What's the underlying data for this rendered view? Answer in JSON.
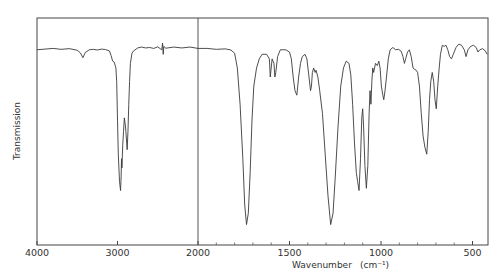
{
  "chart_data": {
    "type": "line",
    "title": "",
    "xlabel": "Wavenumber",
    "xlabel_unit": "(cm⁻¹)",
    "ylabel": "Transmission",
    "x_reversed": true,
    "xlim": [
      4000,
      420
    ],
    "x_scale_break": 2000,
    "ylim": [
      0,
      100
    ],
    "grid": false,
    "legend": "none",
    "x_ticks": [
      4000,
      3000,
      2000,
      1500,
      1000,
      500
    ],
    "x_tick_labels": [
      "4000",
      "3000",
      "2000",
      "1500",
      "1000",
      "500"
    ],
    "series": [
      {
        "name": "IR spectrum",
        "points": [
          [
            4000,
            86
          ],
          [
            3900,
            86.3
          ],
          [
            3800,
            86.6
          ],
          [
            3700,
            86.2
          ],
          [
            3600,
            86.5
          ],
          [
            3500,
            85.8
          ],
          [
            3460,
            84.6
          ],
          [
            3430,
            82.5
          ],
          [
            3400,
            84.8
          ],
          [
            3350,
            86
          ],
          [
            3300,
            86.2
          ],
          [
            3250,
            85.9
          ],
          [
            3200,
            86.3
          ],
          [
            3150,
            86.1
          ],
          [
            3100,
            85.5
          ],
          [
            3080,
            83.5
          ],
          [
            3060,
            81
          ],
          [
            3040,
            80.5
          ],
          [
            3020,
            78
          ],
          [
            3010,
            72
          ],
          [
            3000,
            55
          ],
          [
            2990,
            40
          ],
          [
            2975,
            28
          ],
          [
            2962,
            24
          ],
          [
            2955,
            30
          ],
          [
            2950,
            38
          ],
          [
            2945,
            34
          ],
          [
            2935,
            44
          ],
          [
            2925,
            50
          ],
          [
            2915,
            56
          ],
          [
            2900,
            52
          ],
          [
            2880,
            42
          ],
          [
            2870,
            50
          ],
          [
            2860,
            62
          ],
          [
            2850,
            72
          ],
          [
            2840,
            80
          ],
          [
            2820,
            84.5
          ],
          [
            2800,
            85.5
          ],
          [
            2750,
            86.8
          ],
          [
            2700,
            87.2
          ],
          [
            2650,
            86.8
          ],
          [
            2600,
            87
          ],
          [
            2550,
            86.6
          ],
          [
            2500,
            87.3
          ],
          [
            2470,
            86.5
          ],
          [
            2450,
            86
          ],
          [
            2440,
            89
          ],
          [
            2432,
            84
          ],
          [
            2425,
            87.5
          ],
          [
            2400,
            86.7
          ],
          [
            2300,
            87.2
          ],
          [
            2200,
            86.8
          ],
          [
            2100,
            87.2
          ],
          [
            2000,
            86.6
          ],
          [
            1950,
            86.6
          ],
          [
            1900,
            86.2
          ],
          [
            1850,
            86.4
          ],
          [
            1820,
            85.9
          ],
          [
            1800,
            84.5
          ],
          [
            1785,
            78
          ],
          [
            1770,
            62
          ],
          [
            1755,
            38
          ],
          [
            1745,
            18
          ],
          [
            1735,
            9
          ],
          [
            1725,
            14
          ],
          [
            1715,
            32
          ],
          [
            1705,
            55
          ],
          [
            1695,
            70
          ],
          [
            1680,
            78
          ],
          [
            1665,
            82
          ],
          [
            1650,
            84
          ],
          [
            1625,
            84
          ],
          [
            1610,
            82
          ],
          [
            1605,
            74
          ],
          [
            1600,
            78
          ],
          [
            1595,
            82
          ],
          [
            1585,
            80
          ],
          [
            1580,
            74
          ],
          [
            1575,
            76
          ],
          [
            1565,
            83
          ],
          [
            1550,
            86
          ],
          [
            1520,
            86
          ],
          [
            1500,
            85
          ],
          [
            1490,
            82
          ],
          [
            1480,
            74
          ],
          [
            1470,
            68
          ],
          [
            1460,
            66
          ],
          [
            1455,
            70
          ],
          [
            1450,
            74
          ],
          [
            1440,
            80
          ],
          [
            1430,
            83
          ],
          [
            1415,
            84
          ],
          [
            1405,
            82
          ],
          [
            1395,
            75
          ],
          [
            1385,
            68
          ],
          [
            1380,
            70
          ],
          [
            1375,
            76
          ],
          [
            1368,
            78
          ],
          [
            1360,
            76
          ],
          [
            1355,
            77
          ],
          [
            1345,
            74
          ],
          [
            1335,
            68
          ],
          [
            1320,
            58
          ],
          [
            1305,
            40
          ],
          [
            1290,
            22
          ],
          [
            1275,
            9
          ],
          [
            1262,
            14
          ],
          [
            1250,
            30
          ],
          [
            1235,
            52
          ],
          [
            1220,
            70
          ],
          [
            1205,
            78
          ],
          [
            1190,
            81
          ],
          [
            1175,
            80
          ],
          [
            1165,
            75
          ],
          [
            1155,
            62
          ],
          [
            1145,
            45
          ],
          [
            1135,
            32
          ],
          [
            1128,
            28
          ],
          [
            1120,
            24
          ],
          [
            1112,
            38
          ],
          [
            1105,
            56
          ],
          [
            1100,
            60
          ],
          [
            1095,
            52
          ],
          [
            1088,
            35
          ],
          [
            1080,
            25
          ],
          [
            1072,
            35
          ],
          [
            1065,
            58
          ],
          [
            1060,
            68
          ],
          [
            1055,
            62
          ],
          [
            1050,
            72
          ],
          [
            1045,
            78
          ],
          [
            1040,
            76
          ],
          [
            1030,
            80
          ],
          [
            1020,
            79
          ],
          [
            1012,
            81
          ],
          [
            1005,
            78
          ],
          [
            998,
            70
          ],
          [
            990,
            66
          ],
          [
            985,
            64
          ],
          [
            978,
            68
          ],
          [
            970,
            74
          ],
          [
            960,
            82
          ],
          [
            950,
            86
          ],
          [
            935,
            87
          ],
          [
            920,
            86
          ],
          [
            905,
            86.2
          ],
          [
            890,
            85.4
          ],
          [
            880,
            83
          ],
          [
            872,
            80
          ],
          [
            865,
            82
          ],
          [
            855,
            85
          ],
          [
            845,
            86
          ],
          [
            835,
            83
          ],
          [
            825,
            78
          ],
          [
            818,
            77.5
          ],
          [
            808,
            77
          ],
          [
            800,
            76
          ],
          [
            790,
            70
          ],
          [
            780,
            58
          ],
          [
            770,
            48
          ],
          [
            760,
            43
          ],
          [
            750,
            40
          ],
          [
            742,
            50
          ],
          [
            735,
            64
          ],
          [
            728,
            72
          ],
          [
            720,
            76
          ],
          [
            712,
            72
          ],
          [
            705,
            64
          ],
          [
            698,
            60
          ],
          [
            690,
            70
          ],
          [
            682,
            78
          ],
          [
            675,
            84
          ],
          [
            665,
            88
          ],
          [
            655,
            87.5
          ],
          [
            645,
            88
          ],
          [
            635,
            86
          ],
          [
            625,
            83
          ],
          [
            615,
            82
          ],
          [
            605,
            84
          ],
          [
            590,
            87
          ],
          [
            575,
            88.5
          ],
          [
            560,
            88
          ],
          [
            545,
            86
          ],
          [
            535,
            83
          ],
          [
            525,
            86
          ],
          [
            510,
            87.5
          ],
          [
            495,
            88
          ],
          [
            480,
            87
          ],
          [
            470,
            85
          ],
          [
            460,
            86
          ],
          [
            445,
            86.5
          ],
          [
            430,
            85.5
          ],
          [
            420,
            84
          ]
        ]
      }
    ]
  }
}
